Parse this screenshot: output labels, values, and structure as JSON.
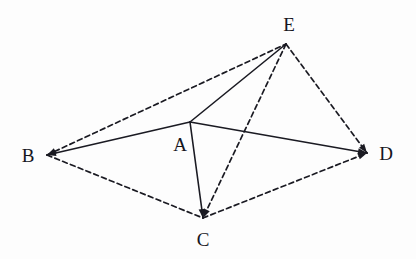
{
  "figure": {
    "type": "geometry-diagram",
    "width": 416,
    "height": 259,
    "background_color": "#fdfdfd",
    "stroke_color": "#1a1a22",
    "solid_stroke_width": 1.6,
    "dashed_stroke_width": 1.7,
    "dash_pattern": "5,3.4",
    "vertices": [
      {
        "id": "A",
        "label": "A",
        "x": 190,
        "y": 122,
        "label_x": 180,
        "label_y": 144
      },
      {
        "id": "B",
        "label": "B",
        "x": 47,
        "y": 155,
        "label_x": 28,
        "label_y": 155
      },
      {
        "id": "C",
        "label": "C",
        "x": 203,
        "y": 218,
        "label_x": 203,
        "label_y": 239
      },
      {
        "id": "D",
        "label": "D",
        "x": 367,
        "y": 153,
        "label_x": 386,
        "label_y": 153
      },
      {
        "id": "E",
        "label": "E",
        "x": 286,
        "y": 44,
        "label_x": 289,
        "label_y": 24
      }
    ],
    "edges": [
      {
        "id": "BA",
        "from": "B",
        "to": "A",
        "style": "solid",
        "arrow_at": "B"
      },
      {
        "id": "AE",
        "from": "A",
        "to": "E",
        "style": "solid",
        "arrow_at": "none"
      },
      {
        "id": "AD",
        "from": "A",
        "to": "D",
        "style": "solid",
        "arrow_at": "D"
      },
      {
        "id": "AC",
        "from": "A",
        "to": "C",
        "style": "solid",
        "arrow_at": "C"
      },
      {
        "id": "BE",
        "from": "B",
        "to": "E",
        "style": "dashed",
        "arrow_at": "B"
      },
      {
        "id": "BC",
        "from": "B",
        "to": "C",
        "style": "dashed",
        "arrow_at": "none"
      },
      {
        "id": "CD",
        "from": "C",
        "to": "D",
        "style": "dashed",
        "arrow_at": "D"
      },
      {
        "id": "ED",
        "from": "E",
        "to": "D",
        "style": "dashed",
        "arrow_at": "D"
      },
      {
        "id": "EC",
        "from": "E",
        "to": "C",
        "style": "dashed",
        "arrow_at": "C"
      }
    ]
  }
}
